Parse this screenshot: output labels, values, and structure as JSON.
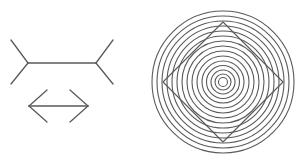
{
  "canvas": {
    "width": 301,
    "height": 164,
    "background_color": "#ffffff"
  },
  "figures": [
    {
      "id": "muller-lyer-fins-out",
      "name": "Muller-Lyer figure with outward fins",
      "type": "line-drawing",
      "stroke_color": "#5a5a5a",
      "stroke_width": 1.3,
      "shaft": {
        "x1": 28,
        "y1": 63,
        "x2": 96,
        "y2": 63
      },
      "fins": [
        {
          "x1": 28,
          "y1": 63,
          "x2": 11,
          "y2": 40
        },
        {
          "x1": 28,
          "y1": 63,
          "x2": 11,
          "y2": 84
        },
        {
          "x1": 96,
          "y1": 63,
          "x2": 113,
          "y2": 40
        },
        {
          "x1": 96,
          "y1": 63,
          "x2": 113,
          "y2": 84
        }
      ]
    },
    {
      "id": "muller-lyer-arrows-out",
      "name": "Muller-Lyer figure with arrowheads",
      "type": "line-drawing",
      "stroke_color": "#5a5a5a",
      "stroke_width": 1.3,
      "shaft": {
        "x1": 29,
        "y1": 106,
        "x2": 88,
        "y2": 106
      },
      "fins": [
        {
          "x1": 29,
          "y1": 106,
          "x2": 47,
          "y2": 90
        },
        {
          "x1": 29,
          "y1": 106,
          "x2": 47,
          "y2": 122
        },
        {
          "x1": 88,
          "y1": 106,
          "x2": 70,
          "y2": 90
        },
        {
          "x1": 88,
          "y1": 106,
          "x2": 70,
          "y2": 122
        }
      ]
    },
    {
      "id": "orbison-illusion",
      "name": "Orbison illusion: square on concentric circles",
      "type": "concentric-circles-with-square",
      "stroke_color": "#5a5a5a",
      "stroke_width": 1.1,
      "center": {
        "cx": 223,
        "cy": 82
      },
      "ring_count": 15,
      "ring_radii": [
        71,
        66,
        61,
        56,
        51,
        46,
        41,
        36,
        31,
        26,
        21,
        16.5,
        12,
        8,
        4.5
      ],
      "square": {
        "rotation_degrees": 45,
        "half_diagonal": 60,
        "vertices": [
          {
            "x": 223,
            "y": 22
          },
          {
            "x": 283,
            "y": 82
          },
          {
            "x": 223,
            "y": 142
          },
          {
            "x": 163,
            "y": 82
          }
        ]
      }
    }
  ]
}
